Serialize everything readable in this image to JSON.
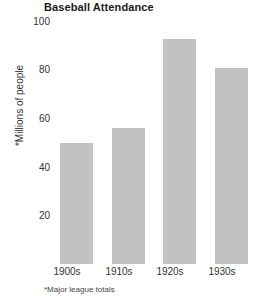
{
  "chart_data": {
    "type": "bar",
    "title": "Baseball Attendance",
    "categories": [
      "1900s",
      "1910s",
      "1920s",
      "1930s"
    ],
    "values": [
      50,
      56,
      93,
      81
    ],
    "xlabel": "",
    "ylabel": "*Millions of people",
    "ylim": [
      0,
      100
    ],
    "yticks": [
      20,
      40,
      60,
      80,
      100
    ],
    "ytick_labels": [
      "20",
      "40",
      "60",
      "80",
      "100"
    ],
    "grid": false,
    "legend": null,
    "footnote": "*Major league totals",
    "bar_color": "#c2c2c2",
    "background_color": "#ffffff"
  }
}
